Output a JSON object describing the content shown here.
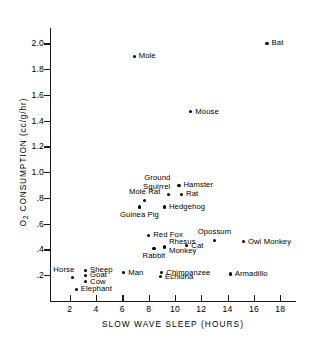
{
  "chart_data": {
    "type": "scatter",
    "title": "",
    "xlabel": "SLOW WAVE SLEEP (HOURS)",
    "ylabel": "O2 CONSUMPTION (cc/g/hr)",
    "xlim": [
      0.5,
      19.2
    ],
    "ylim": [
      0.0,
      2.12
    ],
    "xticks": [
      2,
      4,
      6,
      8,
      10,
      12,
      14,
      16,
      18
    ],
    "xticklabels": [
      "2",
      "4",
      "6",
      "8",
      "10",
      "12",
      "14",
      "16",
      "18"
    ],
    "yticks": [
      0.2,
      0.4,
      0.6,
      0.8,
      1.0,
      1.2,
      1.4,
      1.6,
      1.8,
      2.0
    ],
    "yticklabels": [
      ".2",
      ".4",
      ".6",
      ".8",
      "1.0",
      "1.2",
      "1.4",
      "1.6",
      "1.8",
      "2.0"
    ],
    "grid": false,
    "legend": false,
    "points": [
      {
        "label": "Bat",
        "x": 17.0,
        "y": 2.0,
        "pos": "r"
      },
      {
        "label": "Mole",
        "x": 6.9,
        "y": 1.9,
        "pos": "r"
      },
      {
        "label": "Mouse",
        "x": 11.2,
        "y": 1.47,
        "pos": "r"
      },
      {
        "label": "Hamster",
        "x": 10.3,
        "y": 0.9,
        "pos": "r"
      },
      {
        "label": "Ground\nSquirrel",
        "x": 9.5,
        "y": 0.83,
        "pos": "above-left"
      },
      {
        "label": "Rat",
        "x": 10.5,
        "y": 0.83,
        "pos": "r"
      },
      {
        "label": "Mole Rat",
        "x": 7.7,
        "y": 0.78,
        "pos": "above"
      },
      {
        "label": "Hedgehog",
        "x": 9.2,
        "y": 0.73,
        "pos": "r"
      },
      {
        "label": "Guinea Pig",
        "x": 7.3,
        "y": 0.73,
        "pos": "below"
      },
      {
        "label": "Red Fox",
        "x": 8.0,
        "y": 0.51,
        "pos": "r"
      },
      {
        "label": "Opossum",
        "x": 13.0,
        "y": 0.47,
        "pos": "above"
      },
      {
        "label": "Owl Monkey",
        "x": 15.2,
        "y": 0.46,
        "pos": "r"
      },
      {
        "label": "Cat",
        "x": 10.9,
        "y": 0.43,
        "pos": "r"
      },
      {
        "label": "Rhesus\nMonkey",
        "x": 9.2,
        "y": 0.42,
        "pos": "r"
      },
      {
        "label": "Rabbit",
        "x": 8.4,
        "y": 0.41,
        "pos": "below"
      },
      {
        "label": "Sheep",
        "x": 3.2,
        "y": 0.24,
        "pos": "r"
      },
      {
        "label": "Man",
        "x": 6.1,
        "y": 0.22,
        "pos": "r"
      },
      {
        "label": "Chimpanzee",
        "x": 9.0,
        "y": 0.22,
        "pos": "r"
      },
      {
        "label": "Armadillo",
        "x": 14.2,
        "y": 0.21,
        "pos": "r"
      },
      {
        "label": "Goat",
        "x": 3.2,
        "y": 0.2,
        "pos": "r"
      },
      {
        "label": "Echidna",
        "x": 8.9,
        "y": 0.19,
        "pos": "r"
      },
      {
        "label": "Horse",
        "x": 2.2,
        "y": 0.18,
        "pos": "above-left"
      },
      {
        "label": "Cow",
        "x": 3.2,
        "y": 0.15,
        "pos": "r"
      },
      {
        "label": "Elephant",
        "x": 2.5,
        "y": 0.09,
        "pos": "r"
      }
    ]
  }
}
